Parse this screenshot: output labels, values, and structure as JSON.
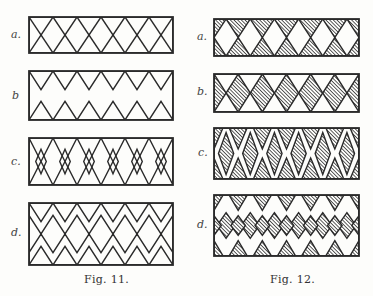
{
  "figures": [
    {
      "caption": "Fig. 11.",
      "style": "outline",
      "panels": [
        {
          "label": "a.",
          "pattern": "lattice",
          "box": [
            29,
            17,
            144,
            36
          ]
        },
        {
          "label": "b",
          "pattern": "opposed-zigzag",
          "box": [
            29,
            71,
            144,
            49
          ]
        },
        {
          "label": "c.",
          "pattern": "zigzag-with-diamonds",
          "box": [
            29,
            138,
            144,
            47
          ]
        },
        {
          "label": "d.",
          "pattern": "double-zigzag-lattice",
          "box": [
            29,
            203,
            144,
            62
          ]
        }
      ]
    },
    {
      "caption": "Fig. 12.",
      "style": "hatched",
      "panels": [
        {
          "label": "a.",
          "pattern": "hatched-triangles",
          "box": [
            214,
            19,
            145,
            37
          ]
        },
        {
          "label": "b.",
          "pattern": "hatched-diamonds",
          "box": [
            214,
            74,
            145,
            38
          ]
        },
        {
          "label": "c.",
          "pattern": "hatched-zigzag-diamonds",
          "box": [
            214,
            128,
            145,
            51
          ]
        },
        {
          "label": "d.",
          "pattern": "hatched-double-zigzag",
          "box": [
            214,
            195,
            145,
            61
          ]
        }
      ]
    }
  ],
  "periods": 6,
  "colors": {
    "ink": "#2a2a2a",
    "paper": "#fdfdfb"
  }
}
